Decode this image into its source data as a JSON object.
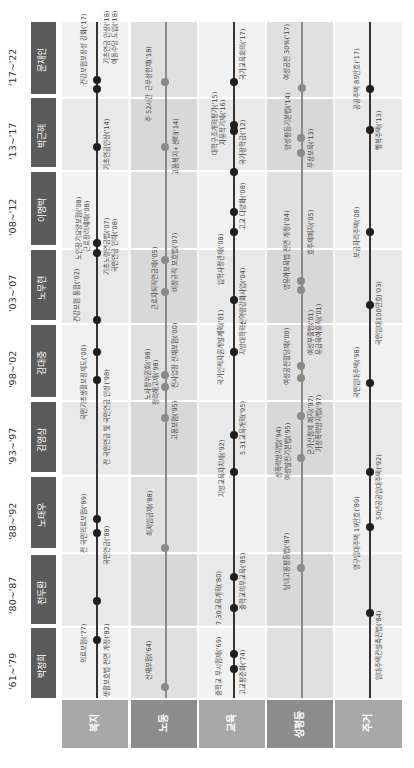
{
  "colors": {
    "pres_box": "#5b5b5b",
    "band_light": "#f0f0f0",
    "band_mid": "#e3e3e3",
    "band_dark": "#d9d9d9",
    "line_dark": "#333333",
    "line_gray": "#8a8a8a",
    "dot_dark": "#1e1e1e",
    "dot_gray": "#8a8a8a",
    "cat_header": [
      "#a8a8a8",
      "#8c8c8c",
      "#a8a8a8",
      "#8c8c8c",
      "#a8a8a8"
    ]
  },
  "presidents": [
    {
      "name": "박정희",
      "years": "'61~'79"
    },
    {
      "name": "전두환",
      "years": "'80~'87"
    },
    {
      "name": "노태우",
      "years": "'88~'92"
    },
    {
      "name": "김영삼",
      "years": "'93~'97"
    },
    {
      "name": "김대중",
      "years": "'98~'02"
    },
    {
      "name": "노무현",
      "years": "'03~'07"
    },
    {
      "name": "이명박",
      "years": "'08~'12"
    },
    {
      "name": "박근혜",
      "years": "'13~'17"
    },
    {
      "name": "문재인",
      "years": "'17~'22"
    }
  ],
  "categories": [
    {
      "name": "복지"
    },
    {
      "name": "노동"
    },
    {
      "name": "교육"
    },
    {
      "name": "성평등"
    },
    {
      "name": "주거"
    }
  ],
  "events": {
    "welfare": [
      {
        "label": "의료보험('77)",
        "side": "L"
      },
      {
        "label": "생활보호법 전면 개정('82)",
        "side": "R"
      },
      {
        "label": "국민연금('88)",
        "side": "R"
      },
      {
        "label": "전 국민의료보험('89)",
        "side": "L"
      },
      {
        "label": "전 국민연금 및 국민연금 인상('98)",
        "side": "R"
      },
      {
        "label": "국민기초생활보장제도('00)",
        "side": "L"
      },
      {
        "label": "건강보험 통합('02)",
        "side": "L"
      },
      {
        "label": "기초노령연금법('07)",
        "side": "R"
      },
      {
        "label": "국민연금 인하('08)",
        "side": "R"
      },
      {
        "label": "근로장려세제('08)",
        "side": "L"
      },
      {
        "label": "노인장기요양보험('08)",
        "side": "L"
      },
      {
        "label": "기초연금인상('14)",
        "side": "R"
      },
      {
        "label": "건강보험보장성 강화('17)",
        "side": "L"
      },
      {
        "label": "기초연금 인상('18)",
        "side": "R"
      },
      {
        "label": "아동수당 도입('18)",
        "side": "R"
      }
    ],
    "labor": [
      {
        "label": "산재보험('64)",
        "side": "L"
      },
      {
        "label": "최저임금제('88)",
        "side": "L"
      },
      {
        "label": "고용보험('95)",
        "side": "R"
      },
      {
        "label": "정리해고제('98)",
        "side": "L"
      },
      {
        "label": "노사정위원회('98)",
        "side": "L"
      },
      {
        "label": "전사업장 산재보험('00)",
        "side": "R"
      },
      {
        "label": "근로자퇴직연금제('05)",
        "side": "L"
      },
      {
        "label": "비정규직 보호법('07)",
        "side": "R"
      },
      {
        "label": "고용복지+센터('14)",
        "side": "R"
      },
      {
        "label": "주 52시간 근무상한제('18)",
        "side": "L"
      }
    ],
    "education": [
      {
        "label": "중학교 무시험제('69)",
        "side": "L"
      },
      {
        "label": "고교평준화('74)",
        "side": "R"
      },
      {
        "label": "7.30교육개혁('80)",
        "side": "L"
      },
      {
        "label": "중학교의무교육('85)",
        "side": "R"
      },
      {
        "label": "지방교육자치제('92)",
        "side": "L"
      },
      {
        "label": "5.31교육개혁('95)",
        "side": "R"
      },
      {
        "label": "국가인적자원개발계획('01)",
        "side": "L"
      },
      {
        "label": "지방대학혁신역량강화사업('04)",
        "side": "R"
      },
      {
        "label": "입학사정관제('08)",
        "side": "L"
      },
      {
        "label": "고교 다양화('08)",
        "side": "R"
      },
      {
        "label": "국가장학금('12)",
        "side": "R"
      },
      {
        "label": "자유학기제('16)",
        "side": "L"
      },
      {
        "label": "대학구조개혁평가('15)",
        "side": "L"
      },
      {
        "label": "국가교육회의('17)",
        "side": "R"
      }
    ],
    "gender": [
      {
        "label": "남녀고용평등법('87)",
        "side": "L"
      },
      {
        "label": "성폭력방지법('94)",
        "side": "L"
      },
      {
        "label": "여성발전기본법('95)",
        "side": "L"
      },
      {
        "label": "군가산점제 폐지('97)",
        "side": "R"
      },
      {
        "label": "가정폭력방지법('97)",
        "side": "R"
      },
      {
        "label": "여성공천할당제('00)",
        "side": "L"
      },
      {
        "label": "여성부출범('01)",
        "side": "R"
      },
      {
        "label": "유급육아휴직('01)",
        "side": "R"
      },
      {
        "label": "영유아보육법 전면 개정('04)",
        "side": "L"
      },
      {
        "label": "호주제폐지('05)",
        "side": "R"
      },
      {
        "label": "무상보육('13)",
        "side": "R"
      },
      {
        "label": "양성평등기본법('14)",
        "side": "L"
      },
      {
        "label": "여성공천 30%('17)",
        "side": "L"
      }
    ],
    "housing": [
      {
        "label": "임대주택건설촉진법('84)",
        "side": "R"
      },
      {
        "label": "영구임대주택 19만호('89)",
        "side": "L"
      },
      {
        "label": "50년공공임대주택('92)",
        "side": "R"
      },
      {
        "label": "국민임대주택('98)",
        "side": "L"
      },
      {
        "label": "국민임대100만호('03)",
        "side": "R"
      },
      {
        "label": "보금자리주택('08)",
        "side": "L"
      },
      {
        "label": "행복주택('13)",
        "side": "R"
      },
      {
        "label": "공공주택 85만호('17)",
        "side": "L"
      }
    ]
  }
}
